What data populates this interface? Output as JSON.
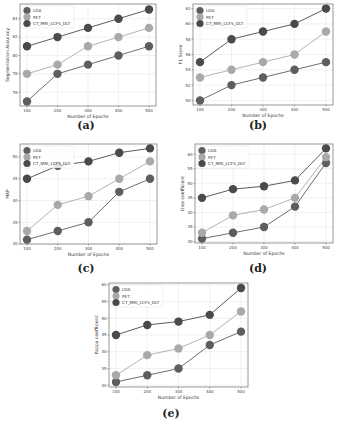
{
  "chart_data": [
    {
      "id": "a",
      "type": "line",
      "caption": "(a)",
      "xlabel": "Number of Epochs",
      "ylabel": "Segmentation Accuracy",
      "x": [
        100,
        200,
        300,
        400,
        500
      ],
      "xticks": [
        "100",
        "200",
        "300",
        "400",
        "500"
      ],
      "yticks": [
        76,
        78,
        80,
        82,
        84
      ],
      "ylim": [
        74.5,
        85.6
      ],
      "grid": true,
      "legend_position": "upper left",
      "series": [
        {
          "name": "LDA",
          "color": "#5e5e5e",
          "values": [
            75,
            78,
            79,
            80,
            81
          ]
        },
        {
          "name": "PET",
          "color": "#a9a9a9",
          "values": [
            78,
            79,
            81,
            82,
            83
          ]
        },
        {
          "name": "CT_MRI_LCFS_DLT",
          "color": "#4a4a4a",
          "values": [
            81,
            82,
            83,
            84,
            85
          ]
        }
      ]
    },
    {
      "id": "b",
      "type": "line",
      "caption": "(b)",
      "xlabel": "Number of Epochs",
      "ylabel": "F1 Score",
      "x": [
        100,
        200,
        300,
        400,
        500
      ],
      "xticks": [
        "100",
        "200",
        "300",
        "400",
        "500"
      ],
      "yticks": [
        50,
        52,
        54,
        56,
        58,
        60,
        62
      ],
      "ylim": [
        49.4,
        62.6
      ],
      "grid": true,
      "legend_position": "upper left",
      "series": [
        {
          "name": "LDA",
          "color": "#5e5e5e",
          "values": [
            50,
            52,
            53,
            54,
            55
          ]
        },
        {
          "name": "PET",
          "color": "#a9a9a9",
          "values": [
            53,
            54,
            55,
            56,
            59
          ]
        },
        {
          "name": "CT_MRI_LCFS_DLT",
          "color": "#4a4a4a",
          "values": [
            55,
            58,
            59,
            60,
            62
          ]
        }
      ]
    },
    {
      "id": "c",
      "type": "line",
      "caption": "(c)",
      "xlabel": "Number of Epochs",
      "ylabel": "MAP",
      "x": [
        100,
        200,
        300,
        400,
        500
      ],
      "xticks": [
        "100",
        "200",
        "300",
        "400",
        "500"
      ],
      "yticks": [
        30,
        35,
        40,
        45,
        50
      ],
      "ylim": [
        30,
        53
      ],
      "grid": true,
      "legend_position": "upper left",
      "series": [
        {
          "name": "LDA",
          "color": "#5e5e5e",
          "values": [
            31,
            33,
            35,
            42,
            45
          ]
        },
        {
          "name": "PET",
          "color": "#a9a9a9",
          "values": [
            33,
            39,
            41,
            45,
            49
          ]
        },
        {
          "name": "CT_MRI_LCFS_DLT",
          "color": "#4a4a4a",
          "values": [
            45,
            48,
            49,
            51,
            52
          ]
        }
      ]
    },
    {
      "id": "d",
      "type": "line",
      "caption": "(d)",
      "xlabel": "Number of Epochs",
      "ylabel": "Dice coefficient",
      "x": [
        100,
        200,
        300,
        400,
        500
      ],
      "xticks": [
        "100",
        "200",
        "300",
        "400",
        "500"
      ],
      "yticks": [
        30,
        35,
        40,
        45,
        50,
        55,
        60
      ],
      "ylim": [
        29.5,
        63.5
      ],
      "grid": true,
      "legend_position": "upper left",
      "series": [
        {
          "name": "LDA",
          "color": "#5e5e5e",
          "values": [
            31,
            33,
            35,
            42,
            57
          ]
        },
        {
          "name": "PET",
          "color": "#a9a9a9",
          "values": [
            33,
            39,
            41,
            45,
            59
          ]
        },
        {
          "name": "CT_MRI_LCFS_DLT",
          "color": "#4a4a4a",
          "values": [
            45,
            48,
            49,
            51,
            62
          ]
        }
      ]
    },
    {
      "id": "e",
      "type": "line",
      "caption": "(e)",
      "xlabel": "Number of Epochs",
      "ylabel": "Kappa coefficient",
      "x": [
        100,
        200,
        300,
        400,
        500
      ],
      "xticks": [
        "100",
        "200",
        "300",
        "400",
        "500"
      ],
      "yticks": [
        30,
        35,
        40,
        45,
        50,
        55,
        60
      ],
      "ylim": [
        29.5,
        60.5
      ],
      "grid": true,
      "legend_position": "upper left",
      "series": [
        {
          "name": "LDA",
          "color": "#5e5e5e",
          "values": [
            31,
            33,
            35,
            42,
            46
          ]
        },
        {
          "name": "PET",
          "color": "#a9a9a9",
          "values": [
            33,
            39,
            41,
            45,
            52
          ]
        },
        {
          "name": "CT_MRI_LCFS_DLT",
          "color": "#4a4a4a",
          "values": [
            45,
            48,
            49,
            51,
            59
          ]
        }
      ]
    }
  ],
  "layout": {
    "panels": [
      {
        "left": 0,
        "top": 0,
        "width": 171,
        "height": 140,
        "caption_left": 66,
        "caption_top": 119
      },
      {
        "left": 171,
        "top": 0,
        "width": 171,
        "height": 140,
        "caption_left": 67,
        "caption_top": 119
      },
      {
        "left": 0,
        "top": 140,
        "width": 171,
        "height": 140,
        "caption_left": 66,
        "caption_top": 122
      },
      {
        "left": 171,
        "top": 140,
        "width": 171,
        "height": 140,
        "caption_left": 67,
        "caption_top": 122
      },
      {
        "left": 85,
        "top": 280,
        "width": 171,
        "height": 144,
        "caption_left": 66,
        "caption_top": 127
      }
    ],
    "plot_boxes": [
      {
        "x": 20,
        "y": 4,
        "w": 136,
        "h": 102
      },
      {
        "x": 22,
        "y": 4,
        "w": 140,
        "h": 101
      },
      {
        "x": 20,
        "y": 4,
        "w": 137,
        "h": 100
      },
      {
        "x": 24,
        "y": 4,
        "w": 138,
        "h": 99
      },
      {
        "x": 24,
        "y": 3,
        "w": 139,
        "h": 104
      }
    ]
  }
}
